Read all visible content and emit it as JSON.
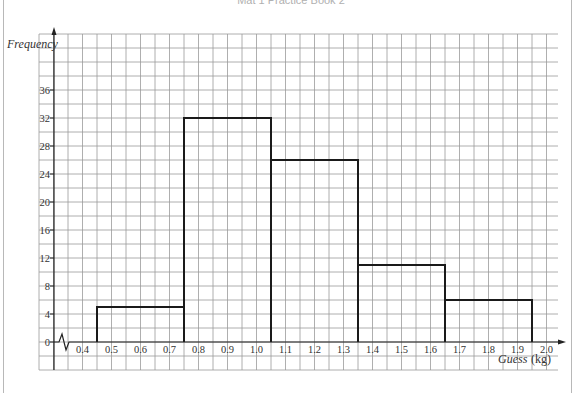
{
  "header": {
    "text": "Mat 1 Practice Book 2"
  },
  "chart_data": {
    "type": "bar",
    "subtype": "histogram",
    "title": "",
    "xlabel": "Guess",
    "xlabel_unit": "(kg)",
    "ylabel": "Frequency",
    "x_ticks": [
      "0.4",
      "0.5",
      "0.6",
      "0.7",
      "0.8",
      "0.9",
      "1.0",
      "1.1",
      "1.2",
      "1.3",
      "1.4",
      "1.5",
      "1.6",
      "1.7",
      "1.8",
      "1.9",
      "2.0"
    ],
    "y_ticks": [
      "0",
      "4",
      "8",
      "12",
      "16",
      "20",
      "24",
      "28",
      "32",
      "36"
    ],
    "xlim": [
      0.35,
      2.05
    ],
    "ylim": [
      -4,
      40
    ],
    "x_axis_break": true,
    "grid": true,
    "legend": null,
    "bins": [
      {
        "from": 0.45,
        "to": 0.75,
        "frequency": 5
      },
      {
        "from": 0.75,
        "to": 1.05,
        "frequency": 32
      },
      {
        "from": 1.05,
        "to": 1.35,
        "frequency": 26
      },
      {
        "from": 1.35,
        "to": 1.65,
        "frequency": 11
      },
      {
        "from": 1.65,
        "to": 1.95,
        "frequency": 6
      }
    ],
    "categories": [
      "0.45-0.75",
      "0.75-1.05",
      "1.05-1.35",
      "1.35-1.65",
      "1.65-1.95"
    ],
    "values": [
      5,
      32,
      26,
      11,
      6
    ]
  }
}
